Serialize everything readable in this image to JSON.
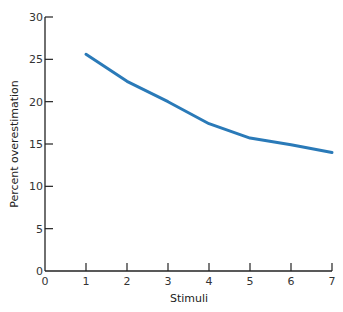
{
  "chart_data": {
    "type": "line",
    "title": "",
    "xlabel": "Stimuli",
    "ylabel": "Percent overestimation",
    "x": [
      1,
      2,
      3,
      4,
      5,
      6,
      7
    ],
    "series": [
      {
        "name": "Percent overestimation",
        "values": [
          25.6,
          22.4,
          20.0,
          17.4,
          15.7,
          14.9,
          14.0
        ],
        "color": "#2a7ab8"
      }
    ],
    "xlim": [
      0,
      7
    ],
    "ylim": [
      0,
      30
    ],
    "xticks": [
      0,
      1,
      2,
      3,
      4,
      5,
      6,
      7
    ],
    "yticks": [
      0,
      5,
      10,
      15,
      20,
      25,
      30
    ],
    "grid": false,
    "legend": null
  }
}
